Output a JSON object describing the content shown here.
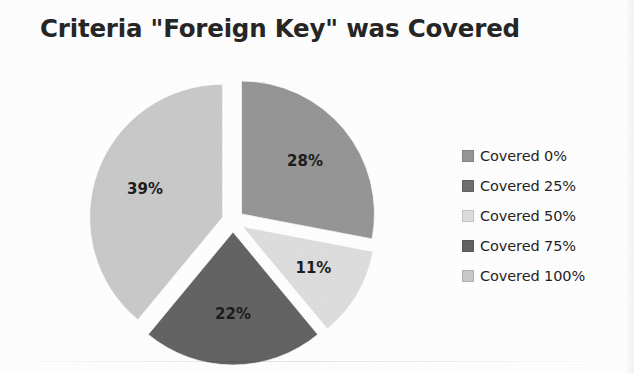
{
  "chart_data": {
    "type": "pie",
    "title": "Criteria \"Foreign Key\" was Covered",
    "xlabel": "",
    "ylabel": "",
    "legend_position": "right",
    "grid": false,
    "exploded": true,
    "categories": [
      "Covered 0%",
      "Covered 25%",
      "Covered 50%",
      "Covered 75%",
      "Covered 100%"
    ],
    "values": [
      28,
      0,
      11,
      22,
      39
    ],
    "value_labels": [
      "28%",
      "",
      "11%",
      "22%",
      "39%"
    ],
    "colors": [
      "#959595",
      "#6e6e6e",
      "#dcdcdc",
      "#636363",
      "#c8c8c8"
    ],
    "slices": [
      {
        "label": "Covered 0%",
        "value": 28,
        "display": "28%",
        "color": "#959595",
        "show_label": true
      },
      {
        "label": "Covered 25%",
        "value": 0,
        "display": "",
        "color": "#6e6e6e",
        "show_label": false
      },
      {
        "label": "Covered 50%",
        "value": 11,
        "display": "11%",
        "color": "#dcdcdc",
        "show_label": true
      },
      {
        "label": "Covered 75%",
        "value": 22,
        "display": "22%",
        "color": "#636363",
        "show_label": true
      },
      {
        "label": "Covered 100%",
        "value": 39,
        "display": "39%",
        "color": "#c8c8c8",
        "show_label": true
      }
    ]
  },
  "title": {
    "text": "Criteria \"Foreign Key\" was Covered"
  },
  "legend": {
    "items": [
      {
        "label": "Covered 0%",
        "color": "#959595"
      },
      {
        "label": "Covered 25%",
        "color": "#6e6e6e"
      },
      {
        "label": "Covered 50%",
        "color": "#dcdcdc"
      },
      {
        "label": "Covered 75%",
        "color": "#636363"
      },
      {
        "label": "Covered 100%",
        "color": "#c8c8c8"
      }
    ]
  }
}
